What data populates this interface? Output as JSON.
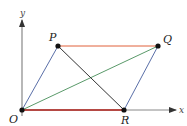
{
  "diagram": {
    "type": "parallelogram-vectors",
    "axes": {
      "x_label": "x",
      "y_label": "y",
      "color": "#555555"
    },
    "points": [
      {
        "id": "O",
        "label": "O",
        "x": 22,
        "y": 110
      },
      {
        "id": "P",
        "label": "P",
        "x": 58,
        "y": 46
      },
      {
        "id": "Q",
        "label": "Q",
        "x": 158,
        "y": 46
      },
      {
        "id": "R",
        "label": "R",
        "x": 124,
        "y": 110
      }
    ],
    "segments": [
      {
        "from": "P",
        "to": "Q",
        "color": "#e0603a"
      },
      {
        "from": "O",
        "to": "R",
        "color": "#b0201a"
      },
      {
        "from": "O",
        "to": "P",
        "color": "#5a6fa8"
      },
      {
        "from": "R",
        "to": "Q",
        "color": "#5a6fa8"
      },
      {
        "from": "O",
        "to": "Q",
        "color": "#5a9a6a"
      },
      {
        "from": "P",
        "to": "R",
        "color": "#333333"
      }
    ]
  }
}
